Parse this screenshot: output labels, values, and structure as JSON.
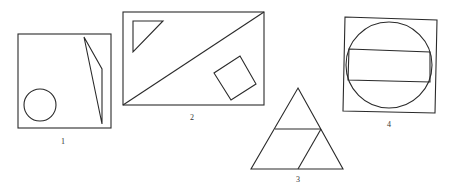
{
  "figures": [
    {
      "id": "1",
      "label": "1",
      "description": "Square containing a circle and a thin triangle"
    },
    {
      "id": "2",
      "label": "2",
      "description": "Rectangle with a diagonal, a small triangle and a rotated square"
    },
    {
      "id": "3",
      "label": "3",
      "description": "Triangle divided into a small triangle, trapezoid pieces"
    },
    {
      "id": "4",
      "label": "4",
      "description": "Square containing an inscribed circle and a rectangle across it"
    }
  ],
  "colors": {
    "stroke": "#2a2a2a",
    "background": "#ffffff"
  }
}
